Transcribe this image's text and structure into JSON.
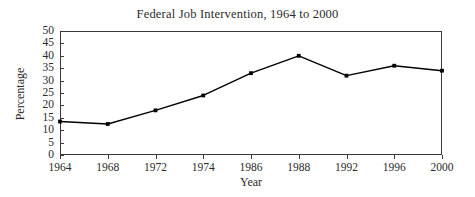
{
  "chart_data": {
    "type": "line",
    "title": "Federal Job Intervention, 1964 to 2000",
    "xlabel": "Year",
    "ylabel": "Percentage",
    "categories": [
      "1964",
      "1968",
      "1972",
      "1974",
      "1986",
      "1988",
      "1992",
      "1996",
      "2000"
    ],
    "values": [
      13.5,
      12.5,
      18,
      24,
      33,
      40,
      32,
      36,
      34
    ],
    "ylim": [
      0,
      50
    ],
    "ytick_interval": 5,
    "yticks": [
      "0",
      "5",
      "10",
      "15",
      "20",
      "25",
      "30",
      "35",
      "40",
      "45",
      "50"
    ],
    "grid": false,
    "legend": false,
    "legend_position": "none",
    "series": [
      {
        "name": "Federal Job Intervention",
        "values": [
          13.5,
          12.5,
          18,
          24,
          33,
          40,
          32,
          36,
          34
        ],
        "color": "#000000",
        "marker": "square"
      }
    ],
    "line_color": "#000000",
    "marker_color": "#000000",
    "axis_color": "#3a3a3a",
    "background_color": "#ffffff"
  }
}
